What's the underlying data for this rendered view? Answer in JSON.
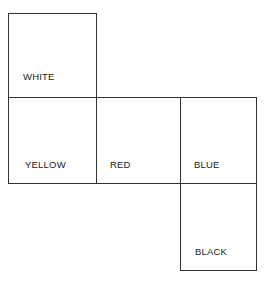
{
  "diagram": {
    "type": "cube-net",
    "faces": [
      {
        "id": "top",
        "label": "WHITE"
      },
      {
        "id": "left",
        "label": "YELLOW"
      },
      {
        "id": "center",
        "label": "RED"
      },
      {
        "id": "right",
        "label": "BLUE"
      },
      {
        "id": "bottom",
        "label": "BLACK"
      }
    ]
  }
}
